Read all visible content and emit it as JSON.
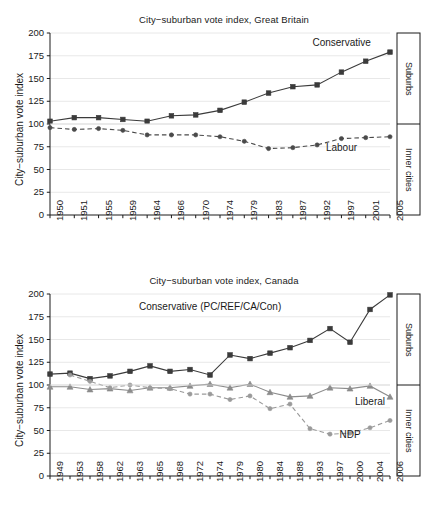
{
  "figure": {
    "width": 448,
    "height": 522,
    "background": "#ffffff",
    "ink": "#1a1a1a"
  },
  "side_panel": {
    "top_label": "Suburbs",
    "bottom_label": "Inner cities"
  },
  "chart_data": [
    {
      "id": "great-britain",
      "type": "line",
      "title": "City−suburban vote index, Great Britain",
      "xlabel": "",
      "ylabel": "City−suburban vote index",
      "ylim": [
        0,
        200
      ],
      "yticks": [
        0,
        25,
        50,
        75,
        100,
        125,
        150,
        175,
        200
      ],
      "grid": true,
      "legend_position": "inline-annotation",
      "categories": [
        "1950",
        "1951",
        "1955",
        "1959",
        "1964",
        "1966",
        "1970",
        "1974",
        "1979",
        "1983",
        "1987",
        "1992",
        "1997",
        "2001",
        "2005"
      ],
      "series": [
        {
          "name": "Conservative",
          "marker": "square",
          "linestyle": "solid",
          "color": "#3b3b3b",
          "values": [
            103,
            107,
            107,
            105,
            103,
            109,
            110,
            115,
            124,
            134,
            141,
            143,
            157,
            169,
            179
          ]
        },
        {
          "name": "Labour",
          "marker": "circle",
          "linestyle": "dashed",
          "color": "#4a4a4a",
          "values": [
            96,
            94,
            95,
            93,
            88,
            88,
            88,
            86,
            81,
            73,
            74,
            77,
            84,
            85,
            86
          ]
        }
      ],
      "annotations": [
        {
          "text": "Conservative",
          "x_category": "1997",
          "y": 188
        },
        {
          "text": "Labour",
          "x_category": "1997",
          "y": 73
        }
      ],
      "reference_line": {
        "y": 100,
        "label": "suburbs / inner cities divide"
      }
    },
    {
      "id": "canada",
      "type": "line",
      "title": "City−suburban vote index, Canada",
      "xlabel": "",
      "ylabel": "City−suburban vote index",
      "ylim": [
        0,
        200
      ],
      "yticks": [
        0,
        25,
        50,
        75,
        100,
        125,
        150,
        175,
        200
      ],
      "grid": true,
      "legend_position": "inline-annotation",
      "categories": [
        "1949",
        "1953",
        "1958",
        "1962",
        "1963",
        "1965",
        "1968",
        "1972",
        "1974",
        "1979",
        "1980",
        "1984",
        "1988",
        "1993",
        "1997",
        "2000",
        "2004",
        "2006"
      ],
      "series": [
        {
          "name": "Conservative (PC/REF/CA/Con)",
          "marker": "square",
          "linestyle": "solid",
          "color": "#3b3b3b",
          "values": [
            112,
            113,
            107,
            110,
            115,
            121,
            115,
            117,
            111,
            133,
            129,
            135,
            141,
            149,
            162,
            147,
            183,
            199
          ]
        },
        {
          "name": "Liberal",
          "marker": "triangle",
          "linestyle": "solid",
          "color": "#8c8c8c",
          "values": [
            98,
            98,
            95,
            96,
            94,
            97,
            97,
            99,
            101,
            97,
            101,
            92,
            87,
            88,
            97,
            96,
            99,
            87
          ]
        },
        {
          "name": "NDP",
          "marker": "circle",
          "linestyle": "dashed",
          "color": "#9a9a9a",
          "values": [
            null,
            111,
            104,
            97,
            100,
            97,
            96,
            90,
            90,
            84,
            88,
            74,
            79,
            52,
            46,
            47,
            53,
            61
          ]
        }
      ],
      "annotations": [
        {
          "text": "Conservative (PC/REF/CA/Con)",
          "x_category": "1974",
          "y": 185
        },
        {
          "text": "Liberal",
          "x_category": "2004",
          "y": 80
        },
        {
          "text": "NDP",
          "x_category": "2000",
          "y": 44
        }
      ],
      "reference_line": {
        "y": 100,
        "label": "suburbs / inner cities divide"
      }
    }
  ]
}
